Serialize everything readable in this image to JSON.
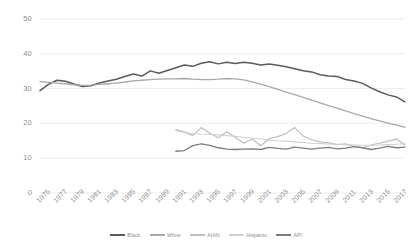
{
  "chart_data": {
    "type": "line",
    "title": "",
    "subtitle": "",
    "xlabel": "",
    "ylabel": "",
    "xlim": [
      1975,
      2018
    ],
    "ylim": [
      0,
      50
    ],
    "grid": true,
    "legend_position": "bottom",
    "yticks": [
      0,
      10,
      20,
      30,
      40,
      50
    ],
    "ytick_labels": [
      "0",
      "10",
      "20",
      "30",
      "40",
      "50"
    ],
    "xticks": [
      1975,
      1977,
      1979,
      1981,
      1983,
      1985,
      1987,
      1989,
      1991,
      1993,
      1995,
      1997,
      1999,
      2001,
      2003,
      2005,
      2007,
      2009,
      2011,
      2013,
      2015,
      2017
    ],
    "xtick_labels": [
      "1975",
      "1977",
      "1979",
      "1981",
      "1983",
      "1985",
      "1987",
      "1989",
      "1991",
      "1993",
      "1995",
      "1997",
      "1999",
      "2001",
      "2003",
      "2005",
      "2007",
      "2009",
      "2011",
      "2013",
      "2015",
      "2017"
    ],
    "series": [
      {
        "name": "Black",
        "color": "#5a5a5a",
        "width": 1.5,
        "x": [
          1975,
          1976,
          1977,
          1978,
          1979,
          1980,
          1981,
          1982,
          1983,
          1984,
          1985,
          1986,
          1987,
          1988,
          1989,
          1990,
          1991,
          1992,
          1993,
          1994,
          1995,
          1996,
          1997,
          1998,
          1999,
          2000,
          2001,
          2002,
          2003,
          2004,
          2005,
          2006,
          2007,
          2008,
          2009,
          2010,
          2011,
          2012,
          2013,
          2014,
          2015,
          2016,
          2017
        ],
        "values": [
          29.4,
          31.2,
          32.4,
          32.1,
          31.3,
          30.6,
          30.8,
          31.6,
          32.2,
          32.7,
          33.5,
          34.2,
          33.6,
          35.1,
          34.4,
          35.2,
          36.0,
          36.8,
          36.4,
          37.3,
          37.7,
          37.1,
          37.6,
          37.2,
          37.6,
          37.3,
          36.8,
          37.1,
          36.7,
          36.3,
          35.7,
          35.1,
          34.8,
          34.0,
          33.6,
          33.5,
          32.6,
          32.2,
          31.5,
          30.2,
          29.1,
          28.2,
          27.6
        ],
        "end_value": 26.2
      },
      {
        "name": "White",
        "color": "#a8a8a8",
        "width": 1.3,
        "x": [
          1975,
          1976,
          1977,
          1978,
          1979,
          1980,
          1981,
          1982,
          1983,
          1984,
          1985,
          1986,
          1987,
          1988,
          1989,
          1990,
          1991,
          1992,
          1993,
          1994,
          1995,
          1996,
          1997,
          1998,
          1999,
          2000,
          2001,
          2002,
          2003,
          2004,
          2005,
          2006,
          2007,
          2008,
          2009,
          2010,
          2011,
          2012,
          2013,
          2014,
          2015,
          2016,
          2017
        ],
        "values": [
          32.0,
          31.8,
          31.6,
          31.4,
          31.1,
          30.9,
          31.0,
          31.2,
          31.4,
          31.6,
          31.9,
          32.2,
          32.4,
          32.6,
          32.7,
          32.8,
          32.8,
          32.9,
          32.7,
          32.6,
          32.6,
          32.7,
          32.9,
          32.8,
          32.5,
          31.9,
          31.3,
          30.6,
          29.8,
          29.0,
          28.3,
          27.5,
          26.7,
          25.9,
          25.1,
          24.4,
          23.6,
          22.8,
          22.1,
          21.4,
          20.7,
          20.1,
          19.5
        ],
        "end_value": 18.9
      },
      {
        "name": "AIAN",
        "color": "#bdbdbd",
        "width": 1.2,
        "x": [
          1991,
          1992,
          1993,
          1994,
          1995,
          1996,
          1997,
          1998,
          1999,
          2000,
          2001,
          2002,
          2003,
          2004,
          2005,
          2006,
          2007,
          2008,
          2009,
          2010,
          2011,
          2012,
          2013,
          2014,
          2015,
          2016,
          2017
        ],
        "values": [
          18.2,
          17.6,
          16.5,
          18.8,
          17.2,
          15.9,
          17.6,
          16.0,
          14.3,
          15.5,
          13.6,
          15.6,
          16.2,
          17.1,
          18.8,
          16.4,
          15.3,
          14.7,
          14.4,
          13.9,
          14.1,
          13.4,
          13.0,
          13.8,
          14.3,
          14.9,
          15.5
        ],
        "end_value": 13.8
      },
      {
        "name": "Hispanic",
        "color": "#d0d0d0",
        "width": 1.1,
        "x": [
          1991,
          1992,
          1993,
          1994,
          1995,
          1996,
          1997,
          1998,
          1999,
          2000,
          2001,
          2002,
          2003,
          2004,
          2005,
          2006,
          2007,
          2008,
          2009,
          2010,
          2011,
          2012,
          2013,
          2014,
          2015,
          2016,
          2017
        ],
        "values": [
          17.9,
          17.4,
          17.1,
          16.9,
          16.8,
          16.7,
          16.5,
          16.3,
          16.0,
          15.8,
          15.5,
          15.2,
          15.0,
          14.9,
          14.7,
          14.5,
          14.3,
          14.2,
          14.1,
          14.0,
          13.9,
          13.8,
          13.7,
          13.7,
          13.8,
          13.9,
          14.0
        ],
        "end_value": 14.2
      },
      {
        "name": "API",
        "color": "#7d7d7d",
        "width": 1.3,
        "x": [
          1991,
          1992,
          1993,
          1994,
          1995,
          1996,
          1997,
          1998,
          1999,
          2000,
          2001,
          2002,
          2003,
          2004,
          2005,
          2006,
          2007,
          2008,
          2009,
          2010,
          2011,
          2012,
          2013,
          2014,
          2015,
          2016,
          2017
        ],
        "values": [
          12.0,
          12.2,
          13.6,
          14.1,
          13.7,
          13.0,
          12.6,
          12.5,
          12.6,
          12.7,
          12.5,
          13.1,
          12.8,
          12.6,
          13.2,
          12.9,
          12.6,
          12.9,
          13.1,
          12.7,
          12.9,
          13.3,
          13.0,
          12.5,
          12.9,
          13.4,
          13.0
        ],
        "end_value": 13.2
      }
    ]
  },
  "legend": {
    "items": [
      {
        "label": "Black"
      },
      {
        "label": "White"
      },
      {
        "label": "AIAN"
      },
      {
        "label": "Hispanic"
      },
      {
        "label": "API"
      }
    ]
  },
  "colors": {
    "grid": "#e8e8e8",
    "tick_text": "#8d8d8d",
    "background": "#ffffff"
  }
}
